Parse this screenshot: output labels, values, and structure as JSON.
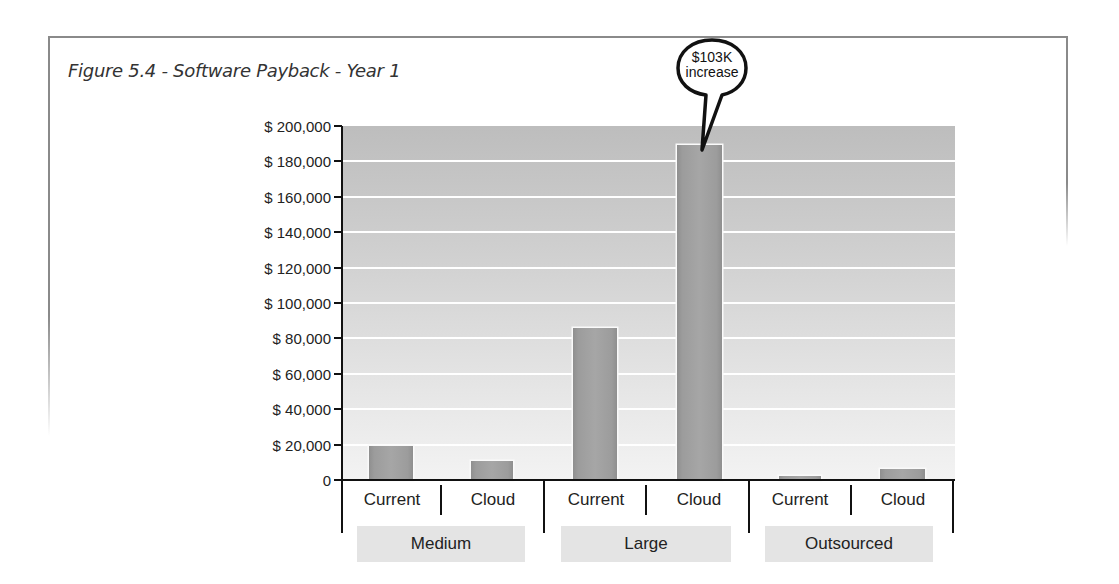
{
  "figure": {
    "title": "Figure 5.4 - Software Payback - Year 1"
  },
  "callout": {
    "line1": "$103K",
    "line2": "increase"
  },
  "y_axis": {
    "ticks": [
      "$ 200,000",
      "$ 180,000",
      "$ 160,000",
      "$ 140,000",
      "$ 120,000",
      "$ 100,000",
      "$ 80,000",
      "$ 60,000",
      "$ 40,000",
      "$ 20,000",
      "0"
    ]
  },
  "x_axis": {
    "groups": [
      {
        "label": "Medium",
        "categories": [
          "Current",
          "Cloud"
        ]
      },
      {
        "label": "Large",
        "categories": [
          "Current",
          "Cloud"
        ]
      },
      {
        "label": "Outsourced",
        "categories": [
          "Current",
          "Cloud"
        ]
      }
    ]
  },
  "colors": {
    "bar": "#a0a0a0",
    "plot_top": "#bdbdbd",
    "plot_bottom": "#f3f3f3",
    "gridline": "#ffffff",
    "group_box": "#e4e4e4",
    "frame": "#8a8a8a"
  },
  "chart_data": {
    "type": "bar",
    "title": "Figure 5.4 - Software Payback - Year 1",
    "xlabel": "",
    "ylabel": "",
    "ylim": [
      0,
      200000
    ],
    "y_tick_step": 20000,
    "grid": true,
    "legend": null,
    "categories": [
      "Medium - Current",
      "Medium - Cloud",
      "Large - Current",
      "Large - Cloud",
      "Outsourced - Current",
      "Outsourced - Cloud"
    ],
    "groups": [
      "Medium",
      "Large",
      "Outsourced"
    ],
    "subcategories": [
      "Current",
      "Cloud"
    ],
    "values": [
      19000,
      11000,
      86000,
      189000,
      2000,
      6000
    ],
    "annotations": [
      {
        "text": "$103K increase",
        "target": "Large - Cloud",
        "type": "speech-bubble"
      }
    ]
  }
}
